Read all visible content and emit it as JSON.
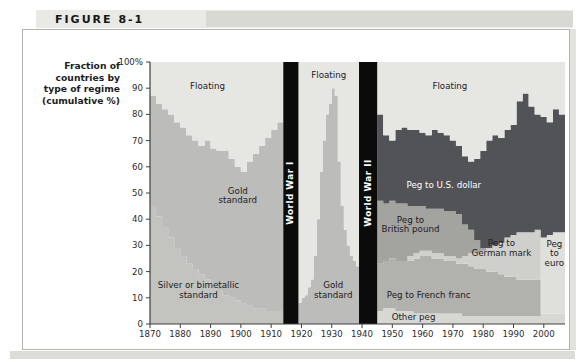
{
  "figure": {
    "label": "FIGURE 8-1"
  },
  "axis": {
    "title": "Fraction of\ncountries by\ntype of regime\n(cumulative %)"
  },
  "chart_data": {
    "type": "area",
    "stacked": true,
    "title": "Fraction of countries by type of regime (cumulative %)",
    "xlabel": "",
    "ylabel": "Fraction of countries by type of regime (cumulative %)",
    "x_range": [
      1870,
      2007
    ],
    "y_range": [
      0,
      100
    ],
    "grid": false,
    "legend": "labels-inside-regions",
    "x_ticks": [
      1870,
      1880,
      1890,
      1900,
      1910,
      1920,
      1930,
      1940,
      1950,
      1960,
      1970,
      1980,
      1990,
      2000
    ],
    "y_ticks": [
      {
        "v": 100,
        "label": "100%"
      },
      {
        "v": 90,
        "label": "90"
      },
      {
        "v": 80,
        "label": "80"
      },
      {
        "v": 70,
        "label": "70"
      },
      {
        "v": 60,
        "label": "60"
      },
      {
        "v": 50,
        "label": "50"
      },
      {
        "v": 40,
        "label": "40"
      },
      {
        "v": 30,
        "label": "30"
      },
      {
        "v": 20,
        "label": "20"
      },
      {
        "v": 10,
        "label": "10"
      },
      {
        "v": 0,
        "label": "0"
      }
    ],
    "colors": {
      "floating": "#e6e6e3",
      "gold": "#bcbcba",
      "silver": "#c3c3c0",
      "dollar": "#525356",
      "pound": "#a3a3a0",
      "mark": "#cfcfcc",
      "franc": "#b1b1ae",
      "euro": "#dfdfdc",
      "other": "#d7d7d4",
      "war_bar": "#0b0b0b",
      "axis_line": "#3f3f3f",
      "tick_text": "#2b2b2b"
    },
    "war_bars": [
      {
        "label": "World War I",
        "from": 1914,
        "to": 1919
      },
      {
        "label": "World War II",
        "from": 1939,
        "to": 1945
      }
    ],
    "panels": [
      {
        "name": "gold-standard-era",
        "x_end": 1914,
        "years": [
          1870,
          1872,
          1874,
          1876,
          1878,
          1880,
          1882,
          1884,
          1886,
          1888,
          1890,
          1892,
          1894,
          1896,
          1898,
          1900,
          1902,
          1904,
          1906,
          1908,
          1910,
          1912
        ],
        "series": [
          {
            "name": "Silver or bimetallic standard",
            "color_key": "silver",
            "cum": [
              45,
              41,
              37,
              33,
              29,
              26,
              23,
              21,
              19,
              17,
              15,
              13,
              11,
              10,
              9,
              8,
              7,
              6,
              6,
              5,
              5,
              5
            ]
          },
          {
            "name": "Gold standard",
            "color_key": "gold",
            "cum": [
              87,
              84,
              82,
              80,
              77,
              75,
              72,
              70,
              68,
              70,
              67,
              66,
              66,
              63,
              60,
              58,
              62,
              65,
              68,
              71,
              74,
              77
            ]
          },
          {
            "name": "Floating",
            "color_key": "floating",
            "cum": 100
          }
        ]
      },
      {
        "name": "interwar-era",
        "x_end": 1939,
        "years": [
          1919,
          1920,
          1921,
          1922,
          1923,
          1924,
          1925,
          1926,
          1927,
          1928,
          1929,
          1930,
          1931,
          1932,
          1933,
          1934,
          1935,
          1936,
          1937,
          1938
        ],
        "series": [
          {
            "name": "Gold standard",
            "color_key": "gold",
            "cum": [
              8,
              10,
              11,
              14,
              17,
              26,
              40,
              58,
              70,
              80,
              84,
              90,
              87,
              62,
              45,
              36,
              30,
              26,
              24,
              22
            ]
          },
          {
            "name": "Floating",
            "color_key": "floating",
            "cum": 100
          }
        ]
      },
      {
        "name": "postwar-era",
        "x_end": 2007,
        "years": [
          1945,
          1947,
          1949,
          1951,
          1953,
          1955,
          1957,
          1959,
          1961,
          1963,
          1965,
          1967,
          1969,
          1971,
          1973,
          1975,
          1977,
          1979,
          1981,
          1983,
          1985,
          1987,
          1989,
          1991,
          1993,
          1995,
          1997,
          1999,
          2001,
          2003,
          2005
        ],
        "series": [
          {
            "name": "Other peg",
            "color_key": "other",
            "cum": [
              5,
              6,
              6,
              5,
              5,
              5,
              4,
              4,
              4,
              4,
              4,
              4,
              4,
              4,
              3,
              3,
              3,
              3,
              3,
              3,
              3,
              3,
              3,
              3,
              3,
              3,
              3,
              4,
              4,
              4,
              4
            ]
          },
          {
            "name": "Peg to French franc",
            "color_key": "franc",
            "cum": [
              23,
              24,
              25,
              24,
              24,
              24,
              25,
              26,
              26,
              25,
              25,
              24,
              24,
              23,
              23,
              22,
              21,
              21,
              20,
              20,
              19,
              18,
              18,
              17,
              17,
              17,
              17,
              4,
              4,
              4,
              4
            ]
          },
          {
            "name": "Peg to German mark",
            "color_key": "mark",
            "cum": [
              23,
              24,
              25,
              24,
              24,
              26,
              27,
              28,
              28,
              27,
              27,
              26,
              26,
              25,
              26,
              27,
              27,
              28,
              29,
              30,
              31,
              33,
              34,
              35,
              35,
              35,
              36,
              4,
              4,
              4,
              4
            ]
          },
          {
            "name": "Peg to euro",
            "color_key": "euro",
            "cum": [
              23,
              24,
              25,
              24,
              24,
              26,
              27,
              28,
              28,
              27,
              27,
              26,
              26,
              25,
              26,
              27,
              27,
              28,
              29,
              30,
              31,
              33,
              34,
              35,
              35,
              35,
              36,
              33,
              34,
              35,
              35
            ]
          },
          {
            "name": "Peg to British pound",
            "color_key": "pound",
            "cum": [
              47,
              46,
              47,
              46,
              46,
              45,
              45,
              45,
              44,
              44,
              44,
              43,
              43,
              42,
              38,
              36,
              32,
              29,
              29,
              30,
              31,
              33,
              34,
              35,
              35,
              35,
              36,
              33,
              34,
              35,
              35
            ]
          },
          {
            "name": "Peg to U.S. dollar",
            "color_key": "dollar",
            "cum": [
              80,
              72,
              70,
              74,
              75,
              74,
              74,
              73,
              72,
              74,
              73,
              72,
              70,
              68,
              64,
              62,
              63,
              66,
              70,
              72,
              71,
              74,
              76,
              85,
              88,
              83,
              80,
              79,
              77,
              82,
              80
            ]
          },
          {
            "name": "Floating",
            "color_key": "floating",
            "cum": 100
          }
        ]
      }
    ],
    "region_labels": [
      {
        "lines": [
          "Floating"
        ],
        "x": 1889,
        "y": 91,
        "color": "#1b1b1b"
      },
      {
        "lines": [
          "Gold",
          "standard"
        ],
        "x": 1899,
        "y": 49,
        "color": "#1b1b1b"
      },
      {
        "lines": [
          "Silver or bimetallic",
          "standard"
        ],
        "x": 1886,
        "y": 13,
        "color": "#1b1b1b"
      },
      {
        "lines": [
          "Floating"
        ],
        "x": 1929,
        "y": 95,
        "color": "#1b1b1b"
      },
      {
        "lines": [
          "Gold",
          "standard"
        ],
        "x": 1930.5,
        "y": 13,
        "color": "#1b1b1b"
      },
      {
        "lines": [
          "Floating"
        ],
        "x": 1969,
        "y": 91,
        "color": "#1b1b1b"
      },
      {
        "lines": [
          "Peg to U.S. dollar"
        ],
        "x": 1967,
        "y": 53,
        "color": "#ffffff"
      },
      {
        "lines": [
          "Peg to",
          "British pound"
        ],
        "x": 1956,
        "y": 38,
        "color": "#1b1b1b"
      },
      {
        "lines": [
          "Peg to",
          "German mark"
        ],
        "x": 1986,
        "y": 29,
        "color": "#1b1b1b"
      },
      {
        "lines": [
          "Peg to French franc"
        ],
        "x": 1962,
        "y": 11,
        "color": "#1b1b1b"
      },
      {
        "lines": [
          "Other peg"
        ],
        "x": 1957,
        "y": 2.5,
        "color": "#1b1b1b"
      },
      {
        "lines": [
          "Peg",
          "to",
          "euro"
        ],
        "x": 2003.5,
        "y": 27,
        "color": "#1b1b1b"
      }
    ]
  }
}
